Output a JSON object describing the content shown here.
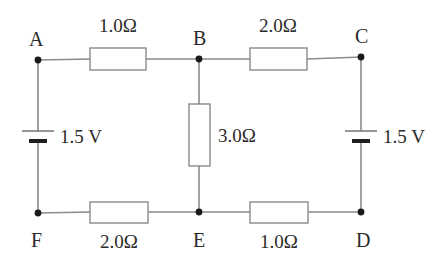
{
  "figure": {
    "type": "circuit-diagram",
    "background_color": "#ffffff",
    "wire_color": "#8a8a8a",
    "component_outline_color": "#8a8a8a",
    "component_fill_color": "#ffffff",
    "node_dot_color": "#1a1a1a",
    "text_color": "#2b2b2b"
  },
  "nodes": [
    {
      "id": "A",
      "label": "A",
      "x": 38,
      "y": 60,
      "label_x": 29,
      "label_y": 29
    },
    {
      "id": "B",
      "label": "B",
      "x": 199,
      "y": 59,
      "label_x": 193,
      "label_y": 28
    },
    {
      "id": "C",
      "label": "C",
      "x": 361,
      "y": 57,
      "label_x": 355,
      "label_y": 26
    },
    {
      "id": "D",
      "label": "D",
      "x": 361,
      "y": 212,
      "label_x": 356,
      "label_y": 230
    },
    {
      "id": "E",
      "label": "E",
      "x": 199,
      "y": 212,
      "label_x": 193,
      "label_y": 230
    },
    {
      "id": "F",
      "label": "F",
      "x": 38,
      "y": 213,
      "label_x": 31,
      "label_y": 230
    }
  ],
  "components": [
    {
      "id": "R-AB",
      "kind": "resistor",
      "orientation": "horizontal",
      "between": "A-B",
      "value": "1.0Ω",
      "box": {
        "x": 90,
        "y": 48,
        "w": 56,
        "h": 22
      },
      "label_x": 118,
      "label_y": 16
    },
    {
      "id": "R-BC",
      "kind": "resistor",
      "orientation": "horizontal",
      "between": "B-C",
      "value": "2.0Ω",
      "box": {
        "x": 250,
        "y": 48,
        "w": 57,
        "h": 22
      },
      "label_x": 278,
      "label_y": 16
    },
    {
      "id": "R-BE",
      "kind": "resistor",
      "orientation": "vertical",
      "between": "B-E",
      "value": "3.0Ω",
      "box": {
        "x": 189,
        "y": 104,
        "w": 21,
        "h": 62
      },
      "label_x": 218,
      "label_y": 126
    },
    {
      "id": "R-FE",
      "kind": "resistor",
      "orientation": "horizontal",
      "between": "F-E",
      "value": "2.0Ω",
      "box": {
        "x": 90,
        "y": 202,
        "w": 58,
        "h": 21
      },
      "label_x": 119,
      "label_y": 232
    },
    {
      "id": "R-ED",
      "kind": "resistor",
      "orientation": "horizontal",
      "between": "E-D",
      "value": "1.0Ω",
      "box": {
        "x": 250,
        "y": 202,
        "w": 58,
        "h": 21
      },
      "label_x": 279,
      "label_y": 232
    },
    {
      "id": "BAT-AF",
      "kind": "battery",
      "orientation": "vertical",
      "between": "A-F",
      "value": "1.5 V",
      "center_x": 38,
      "long_plate_y": 131,
      "long_plate_half_width": 16,
      "short_plate_y": 141,
      "short_plate_half_width": 9,
      "short_plate_thickness": 4,
      "label_x": 60,
      "label_y": 127
    },
    {
      "id": "BAT-CD",
      "kind": "battery",
      "orientation": "vertical",
      "between": "C-D",
      "value": "1.5 V",
      "center_x": 361,
      "long_plate_y": 131,
      "long_plate_half_width": 16,
      "short_plate_y": 141,
      "short_plate_half_width": 9,
      "short_plate_thickness": 4,
      "label_x": 383,
      "label_y": 127
    }
  ],
  "wires": [
    {
      "id": "wire-A-to-RAB",
      "x1": 38,
      "y1": 60,
      "x2": 90,
      "y2": 59
    },
    {
      "id": "wire-RAB-to-B",
      "x1": 146,
      "y1": 59,
      "x2": 199,
      "y2": 59
    },
    {
      "id": "wire-B-to-RBC",
      "x1": 199,
      "y1": 59,
      "x2": 250,
      "y2": 59
    },
    {
      "id": "wire-RBC-to-C",
      "x1": 307,
      "y1": 59,
      "x2": 361,
      "y2": 57
    },
    {
      "id": "wire-A-down-to-battery",
      "x1": 38,
      "y1": 60,
      "x2": 38,
      "y2": 131
    },
    {
      "id": "wire-battery-down-to-F",
      "x1": 38,
      "y1": 141,
      "x2": 38,
      "y2": 213
    },
    {
      "id": "wire-C-down-to-battery",
      "x1": 361,
      "y1": 57,
      "x2": 361,
      "y2": 131
    },
    {
      "id": "wire-battery-down-to-D",
      "x1": 361,
      "y1": 141,
      "x2": 361,
      "y2": 212
    },
    {
      "id": "wire-B-down-to-RBE",
      "x1": 199,
      "y1": 59,
      "x2": 199,
      "y2": 104
    },
    {
      "id": "wire-RBE-down-to-E",
      "x1": 199,
      "y1": 166,
      "x2": 199,
      "y2": 212
    },
    {
      "id": "wire-F-to-RFE",
      "x1": 38,
      "y1": 213,
      "x2": 90,
      "y2": 212
    },
    {
      "id": "wire-RFE-to-E",
      "x1": 148,
      "y1": 212,
      "x2": 199,
      "y2": 212
    },
    {
      "id": "wire-E-to-RED",
      "x1": 199,
      "y1": 212,
      "x2": 250,
      "y2": 212
    },
    {
      "id": "wire-RED-to-D",
      "x1": 308,
      "y1": 212,
      "x2": 361,
      "y2": 212
    }
  ]
}
